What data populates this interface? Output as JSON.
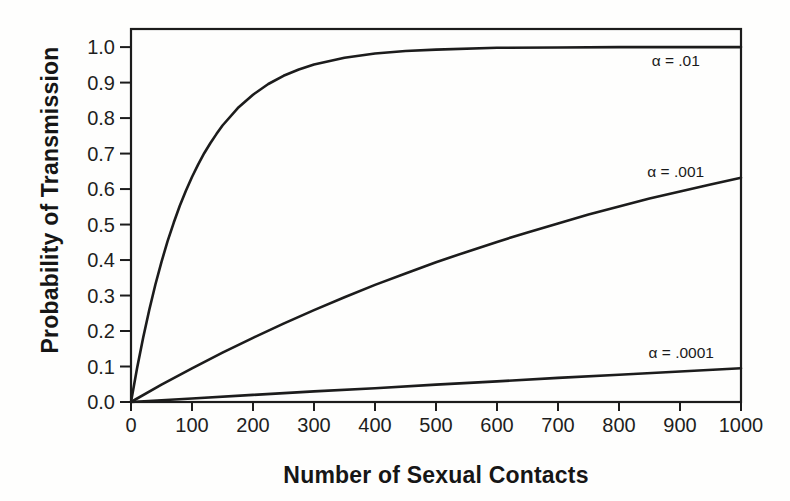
{
  "chart_data": {
    "type": "line",
    "title": "",
    "xlabel": "Number of Sexual Contacts",
    "ylabel": "Probability of Transmission",
    "xlim": [
      0,
      1000
    ],
    "ylim": [
      0,
      1.051
    ],
    "grid": false,
    "legend": "inline-labels",
    "line_color": "#1c1c1c",
    "background_color": "#fefefd",
    "x_ticks": [
      0,
      100,
      200,
      300,
      400,
      500,
      600,
      700,
      800,
      900,
      1000
    ],
    "x_tick_labels": [
      "0",
      "100",
      "200",
      "300",
      "400",
      "500",
      "600",
      "700",
      "800",
      "900",
      "1000"
    ],
    "y_ticks": [
      0,
      0.1,
      0.2,
      0.3,
      0.4,
      0.5,
      0.6,
      0.7,
      0.8,
      0.9,
      1.0
    ],
    "y_tick_labels": [
      "0.0",
      "0.1",
      "0.2",
      "0.3",
      "0.4",
      "0.5",
      "0.6",
      "0.7",
      "0.8",
      "0.9",
      "1.0"
    ],
    "series": [
      {
        "name": "alpha-0.01",
        "label": "α = .01",
        "alpha": 0.01,
        "label_at": [
          893,
          0.96
        ],
        "x": [
          0,
          10,
          20,
          30,
          40,
          50,
          60,
          70,
          80,
          90,
          100,
          110,
          120,
          130,
          140,
          150,
          175,
          200,
          225,
          250,
          275,
          300,
          350,
          400,
          450,
          500,
          600,
          700,
          800,
          900,
          1000
        ],
        "y": [
          0,
          0.096,
          0.182,
          0.26,
          0.331,
          0.395,
          0.453,
          0.505,
          0.553,
          0.595,
          0.634,
          0.669,
          0.701,
          0.729,
          0.755,
          0.779,
          0.828,
          0.866,
          0.896,
          0.919,
          0.937,
          0.951,
          0.97,
          0.982,
          0.989,
          0.993,
          0.998,
          0.999,
          1.0,
          1.0,
          1.0
        ]
      },
      {
        "name": "alpha-0.001",
        "label": "α = .001",
        "alpha": 0.001,
        "label_at": [
          893,
          0.648
        ],
        "x": [
          0,
          50,
          100,
          150,
          200,
          250,
          300,
          350,
          400,
          450,
          500,
          550,
          600,
          650,
          700,
          750,
          800,
          850,
          900,
          950,
          1000
        ],
        "y": [
          0,
          0.049,
          0.095,
          0.139,
          0.181,
          0.221,
          0.259,
          0.295,
          0.33,
          0.362,
          0.394,
          0.423,
          0.451,
          0.478,
          0.503,
          0.528,
          0.551,
          0.573,
          0.593,
          0.613,
          0.632
        ]
      },
      {
        "name": "alpha-0.0001",
        "label": "α = .0001",
        "alpha": 0.0001,
        "label_at": [
          902,
          0.138
        ],
        "x": [
          0,
          100,
          200,
          300,
          400,
          500,
          600,
          700,
          800,
          900,
          1000
        ],
        "y": [
          0,
          0.01,
          0.02,
          0.03,
          0.039,
          0.049,
          0.058,
          0.068,
          0.077,
          0.086,
          0.095
        ]
      }
    ]
  }
}
